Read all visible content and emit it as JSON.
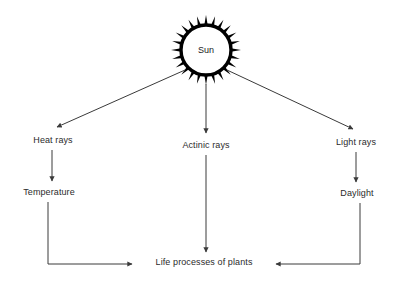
{
  "diagram": {
    "background_color": "#ffffff",
    "line_color": "#3a3a3a",
    "text_color": "#2b2b2b",
    "sun": {
      "label": "Sun",
      "icon": "sun-icon",
      "center_x": 206,
      "center_y": 50,
      "core_radius": 25,
      "ray_count": 24,
      "ray_length": 10,
      "fill": "#ffffff",
      "stroke": "#000000"
    },
    "nodes": [
      {
        "id": "heat-rays",
        "label": "Heat rays",
        "x": 53,
        "y": 140
      },
      {
        "id": "actinic-rays",
        "label": "Actinic rays",
        "x": 206,
        "y": 145
      },
      {
        "id": "light-rays",
        "label": "Light rays",
        "x": 356,
        "y": 142
      },
      {
        "id": "temperature",
        "label": "Temperature",
        "x": 49,
        "y": 192
      },
      {
        "id": "daylight",
        "label": "Daylight",
        "x": 357,
        "y": 193
      },
      {
        "id": "life-processes",
        "label": "Life processes of plants",
        "x": 204,
        "y": 262
      }
    ],
    "edges": [
      {
        "id": "sun-to-heat-rays",
        "from": "sun",
        "to": "heat-rays",
        "style": "diagonal"
      },
      {
        "id": "sun-to-actinic-rays",
        "from": "sun",
        "to": "actinic-rays",
        "style": "vertical"
      },
      {
        "id": "sun-to-light-rays",
        "from": "sun",
        "to": "light-rays",
        "style": "diagonal"
      },
      {
        "id": "heat-rays-to-temperature",
        "from": "heat-rays",
        "to": "temperature",
        "style": "vertical"
      },
      {
        "id": "light-rays-to-daylight",
        "from": "light-rays",
        "to": "daylight",
        "style": "vertical"
      },
      {
        "id": "actinic-rays-to-life",
        "from": "actinic-rays",
        "to": "life-processes",
        "style": "vertical"
      },
      {
        "id": "temperature-to-life",
        "from": "temperature",
        "to": "life-processes",
        "style": "elbow-right"
      },
      {
        "id": "daylight-to-life",
        "from": "daylight",
        "to": "life-processes",
        "style": "elbow-left"
      }
    ]
  }
}
